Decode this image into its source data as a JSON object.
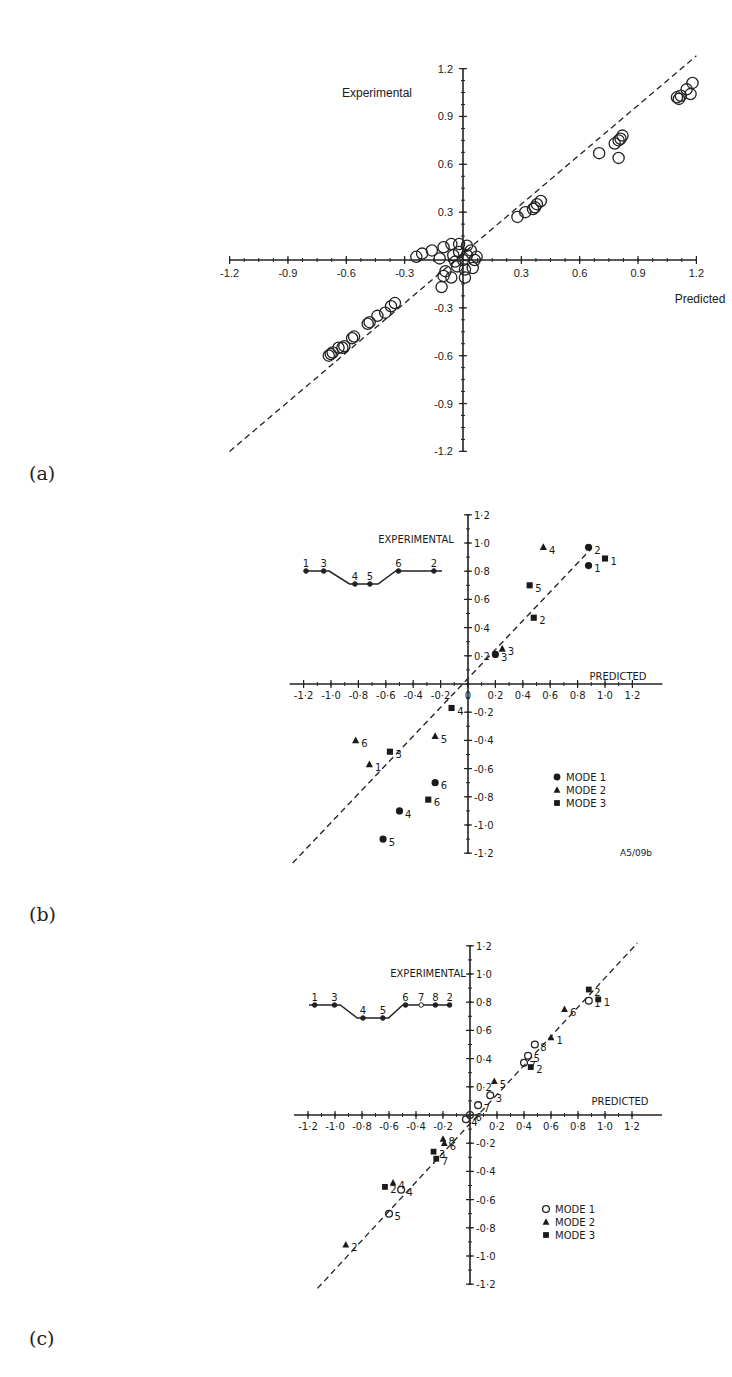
{
  "panels": [
    {
      "id": "a",
      "label": "(a)"
    },
    {
      "id": "b",
      "label": "(b)"
    },
    {
      "id": "c",
      "label": "(c)"
    }
  ],
  "chart_data": [
    {
      "panel": "(a)",
      "type": "scatter",
      "title": "",
      "xlabel": "Predicted",
      "ylabel": "Experimental",
      "xlim": [
        -1.2,
        1.2
      ],
      "ylim": [
        -1.2,
        1.2
      ],
      "xticks": [
        "-1.2",
        "-0.9",
        "-0.6",
        "-0.3",
        "0.3",
        "0.6",
        "0.9",
        "1.2"
      ],
      "yticks": [
        "1.2",
        "0.9",
        "0.6",
        "0.3",
        "-0.3",
        "-0.6",
        "-0.9",
        "-1.2"
      ],
      "grid": false,
      "reference_line": "y = x (dashed)",
      "marker": "open-circle",
      "series": [
        {
          "name": "data",
          "points": [
            [
              1.18,
              1.11
            ],
            [
              1.15,
              1.07
            ],
            [
              1.17,
              1.04
            ],
            [
              1.1,
              1.02
            ],
            [
              1.11,
              1.01
            ],
            [
              1.12,
              1.03
            ],
            [
              0.82,
              0.78
            ],
            [
              0.8,
              0.75
            ],
            [
              0.78,
              0.73
            ],
            [
              0.81,
              0.76
            ],
            [
              0.8,
              0.64
            ],
            [
              0.7,
              0.67
            ],
            [
              0.4,
              0.37
            ],
            [
              0.38,
              0.35
            ],
            [
              0.37,
              0.33
            ],
            [
              0.36,
              0.32
            ],
            [
              0.32,
              0.3
            ],
            [
              0.28,
              0.27
            ],
            [
              -0.24,
              0.02
            ],
            [
              -0.21,
              0.04
            ],
            [
              -0.16,
              0.06
            ],
            [
              -0.1,
              0.08
            ],
            [
              -0.06,
              0.1
            ],
            [
              -0.12,
              0.01
            ],
            [
              -0.09,
              -0.07
            ],
            [
              -0.1,
              -0.1
            ],
            [
              -0.11,
              -0.17
            ],
            [
              -0.06,
              -0.11
            ],
            [
              -0.02,
              0.1
            ],
            [
              0.02,
              0.09
            ],
            [
              0.07,
              0.02
            ],
            [
              0.05,
              -0.05
            ],
            [
              0.01,
              -0.11
            ],
            [
              -0.03,
              -0.04
            ],
            [
              0.0,
              0.0
            ],
            [
              0.02,
              0.03
            ],
            [
              -0.02,
              0.05
            ],
            [
              0.04,
              0.06
            ],
            [
              -0.04,
              -0.01
            ],
            [
              0.01,
              -0.06
            ],
            [
              0.06,
              0.0
            ],
            [
              -0.05,
              0.03
            ],
            [
              -0.35,
              -0.27
            ],
            [
              -0.37,
              -0.29
            ],
            [
              -0.4,
              -0.33
            ],
            [
              -0.44,
              -0.35
            ],
            [
              -0.48,
              -0.39
            ],
            [
              -0.49,
              -0.4
            ],
            [
              -0.56,
              -0.48
            ],
            [
              -0.57,
              -0.49
            ],
            [
              -0.61,
              -0.54
            ],
            [
              -0.62,
              -0.55
            ],
            [
              -0.64,
              -0.55
            ],
            [
              -0.67,
              -0.58
            ],
            [
              -0.68,
              -0.59
            ],
            [
              -0.69,
              -0.6
            ]
          ]
        }
      ]
    },
    {
      "panel": "(b)",
      "type": "scatter",
      "title": "",
      "xlabel": "PREDICTED",
      "ylabel": "EXPERIMENTAL",
      "xlim": [
        -1.2,
        1.2
      ],
      "ylim": [
        -1.2,
        1.2
      ],
      "xticks": [
        "-1·2",
        "-1·0",
        "-0·8",
        "-0·6",
        "-0·4",
        "-0·2",
        "0",
        "0·2",
        "0·4",
        "0·6",
        "0·8",
        "1·0",
        "1·2"
      ],
      "yticks": [
        "1·2",
        "1·0",
        "0·8",
        "0·6",
        "0·4",
        "0·2",
        "-0·2",
        "-0·4",
        "-0·6",
        "-0·8",
        "-1·0",
        "-1·2"
      ],
      "grid": false,
      "reference_line": "y = x (dashed)",
      "legend": {
        "position": "lower-right",
        "entries": [
          "MODE 1",
          "MODE 2",
          "MODE 3"
        ]
      },
      "annotation": "A5/09b",
      "inset_profile_labels": [
        "1",
        "3",
        "4",
        "5",
        "6",
        "2"
      ],
      "series": [
        {
          "name": "MODE 1",
          "marker": "filled-circle",
          "points": [
            {
              "x": 0.88,
              "y": 0.97,
              "label": "2"
            },
            {
              "x": 0.88,
              "y": 0.84,
              "label": "1"
            },
            {
              "x": 0.2,
              "y": 0.21,
              "label": "3"
            },
            {
              "x": -0.24,
              "y": -0.7,
              "label": "6"
            },
            {
              "x": -0.5,
              "y": -0.9,
              "label": "4"
            },
            {
              "x": -0.62,
              "y": -1.1,
              "label": "5"
            }
          ]
        },
        {
          "name": "MODE 2",
          "marker": "filled-triangle",
          "points": [
            {
              "x": 0.55,
              "y": 0.97,
              "label": "4"
            },
            {
              "x": 0.25,
              "y": 0.25,
              "label": "3"
            },
            {
              "x": -0.24,
              "y": -0.37,
              "label": "5"
            },
            {
              "x": -0.72,
              "y": -0.57,
              "label": "1"
            },
            {
              "x": -0.82,
              "y": -0.4,
              "label": "6"
            }
          ]
        },
        {
          "name": "MODE 3",
          "marker": "filled-square",
          "points": [
            {
              "x": 1.0,
              "y": 0.89,
              "label": "1"
            },
            {
              "x": 0.45,
              "y": 0.7,
              "label": "5"
            },
            {
              "x": 0.48,
              "y": 0.47,
              "label": "2"
            },
            {
              "x": -0.12,
              "y": -0.17,
              "label": "4"
            },
            {
              "x": -0.57,
              "y": -0.48,
              "label": "3"
            },
            {
              "x": -0.29,
              "y": -0.82,
              "label": "6"
            }
          ]
        }
      ]
    },
    {
      "panel": "(c)",
      "type": "scatter",
      "title": "",
      "xlabel": "PREDICTED",
      "ylabel": "EXPERIMENTAL",
      "xlim": [
        -1.2,
        1.2
      ],
      "ylim": [
        -1.2,
        1.2
      ],
      "xticks": [
        "-1·2",
        "-1·0",
        "-0·8",
        "-0·6",
        "-0·4",
        "-0·2",
        "0·2",
        "0·4",
        "0·6",
        "0·8",
        "1·0",
        "1·2"
      ],
      "yticks": [
        "1·2",
        "1·0",
        "0·8",
        "0·6",
        "0·4",
        "0·2",
        "-0·2",
        "-0·4",
        "-0·6",
        "-0·8",
        "-1·0",
        "-1·2"
      ],
      "grid": false,
      "reference_line": "y = x (dashed)",
      "legend": {
        "position": "lower-right",
        "entries": [
          "MODE 1",
          "MODE 2",
          "MODE 3"
        ]
      },
      "inset_profile_labels": [
        "1",
        "3",
        "4",
        "5",
        "6",
        "7",
        "8",
        "2"
      ],
      "series": [
        {
          "name": "MODE 1",
          "marker": "open-circle",
          "points": [
            {
              "x": 0.88,
              "y": 0.81,
              "label": "1"
            },
            {
              "x": 0.48,
              "y": 0.5,
              "label": "8"
            },
            {
              "x": 0.43,
              "y": 0.42,
              "label": "5"
            },
            {
              "x": 0.4,
              "y": 0.37,
              "label": "7"
            },
            {
              "x": 0.15,
              "y": 0.14,
              "label": "3"
            },
            {
              "x": 0.06,
              "y": 0.07,
              "label": "7"
            },
            {
              "x": 0.0,
              "y": 0.0,
              "label": "6"
            },
            {
              "x": -0.03,
              "y": -0.03,
              "label": "4"
            },
            {
              "x": -0.51,
              "y": -0.53,
              "label": "4"
            },
            {
              "x": -0.6,
              "y": -0.7,
              "label": "5"
            }
          ]
        },
        {
          "name": "MODE 2",
          "marker": "triangle",
          "points": [
            {
              "x": 0.7,
              "y": 0.75,
              "label": "6"
            },
            {
              "x": 0.6,
              "y": 0.55,
              "label": "1"
            },
            {
              "x": 0.18,
              "y": 0.24,
              "label": "5"
            },
            {
              "x": -0.2,
              "y": -0.17,
              "label": "8"
            },
            {
              "x": -0.19,
              "y": -0.2,
              "label": "6"
            },
            {
              "x": -0.57,
              "y": -0.48,
              "label": "4"
            },
            {
              "x": -0.92,
              "y": -0.92,
              "label": "2"
            }
          ]
        },
        {
          "name": "MODE 3",
          "marker": "filled-square",
          "points": [
            {
              "x": 0.88,
              "y": 0.89,
              "label": "2"
            },
            {
              "x": 0.95,
              "y": 0.82,
              "label": "1"
            },
            {
              "x": 0.45,
              "y": 0.34,
              "label": "2"
            },
            {
              "x": -0.27,
              "y": -0.26,
              "label": "3"
            },
            {
              "x": -0.25,
              "y": -0.31,
              "label": "7"
            },
            {
              "x": -0.63,
              "y": -0.51,
              "label": "2"
            }
          ]
        }
      ]
    }
  ]
}
